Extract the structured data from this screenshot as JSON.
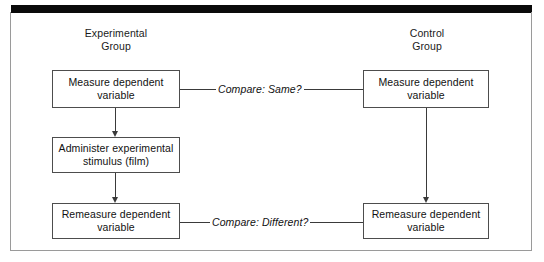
{
  "diagram": {
    "columns": [
      {
        "id": "experimental",
        "header_line1": "Experimental",
        "header_line2": "Group"
      },
      {
        "id": "control",
        "header_line1": "Control",
        "header_line2": "Group"
      }
    ],
    "boxes": {
      "exp_measure": {
        "line1": "Measure dependent",
        "line2": "variable"
      },
      "exp_stimulus": {
        "line1": "Administer experimental",
        "line2": "stimulus (film)"
      },
      "exp_remeasure": {
        "line1": "Remeasure dependent",
        "line2": "variable"
      },
      "ctl_measure": {
        "line1": "Measure dependent",
        "line2": "variable"
      },
      "ctl_remeasure": {
        "line1": "Remeasure dependent",
        "line2": "variable"
      }
    },
    "connectors": {
      "compare_top": "Compare: Same?",
      "compare_bottom": "Compare: Different?"
    },
    "colors": {
      "line": "#3a3a3a",
      "box_border": "#4d4d4d",
      "frame": "#9a9a9a",
      "top_bar": "#0a0a0a",
      "text": "#111111",
      "background": "#ffffff"
    }
  }
}
